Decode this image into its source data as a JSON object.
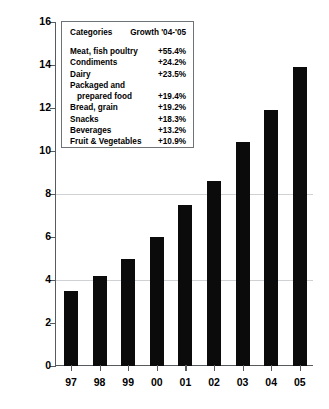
{
  "chart_data": {
    "type": "bar",
    "title": "",
    "xlabel": "",
    "ylabel": "Total sales [$ Billion]",
    "categories": [
      "97",
      "98",
      "99",
      "00",
      "01",
      "02",
      "03",
      "04",
      "05"
    ],
    "values": [
      3.5,
      4.2,
      5.0,
      6.0,
      7.5,
      8.6,
      10.4,
      11.9,
      13.9
    ],
    "ylim": [
      0,
      16
    ],
    "yticks": [
      0,
      2,
      4,
      6,
      8,
      10,
      12,
      14,
      16
    ],
    "ytick_labels": [
      "0",
      "2",
      "4",
      "6",
      "8",
      "10",
      "12",
      "14",
      "16"
    ],
    "grid": true,
    "legend_position": "upper-left-inset",
    "bar_color": "#0b0b0b",
    "series": [
      {
        "name": "Total sales",
        "values": [
          3.5,
          4.2,
          5.0,
          6.0,
          7.5,
          8.6,
          10.4,
          11.9,
          13.9
        ]
      }
    ],
    "annotations": {
      "table_title_left": "Categories",
      "table_title_right": "Growth '04-'05",
      "rows": [
        {
          "category": "Meat, fish poultry",
          "growth": "+55.4%"
        },
        {
          "category": "Condiments",
          "growth": "+24.2%"
        },
        {
          "category": "Dairy",
          "growth": "+23.5%"
        },
        {
          "category": "Packaged and",
          "growth": ""
        },
        {
          "category": "prepared food",
          "growth": "+19.4%"
        },
        {
          "category": "Bread, grain",
          "growth": "+19.2%"
        },
        {
          "category": "Snacks",
          "growth": "+18.3%"
        },
        {
          "category": "Beverages",
          "growth": "+13.2%"
        },
        {
          "category": "Fruit & Vegetables",
          "growth": "+10.9%"
        }
      ]
    }
  },
  "axis": {
    "y_title": "Total sales [$ Billion]"
  },
  "legend": {
    "header_left": "Categories",
    "header_right": "Growth '04-'05",
    "items": [
      {
        "label": "Meat, fish poultry",
        "value": "+55.4%",
        "indent": false
      },
      {
        "label": "Condiments",
        "value": "+24.2%",
        "indent": false
      },
      {
        "label": "Dairy",
        "value": "+23.5%",
        "indent": false
      },
      {
        "label": "Packaged and",
        "value": "",
        "indent": false
      },
      {
        "label": "prepared food",
        "value": "+19.4%",
        "indent": true
      },
      {
        "label": "Bread, grain",
        "value": "+19.2%",
        "indent": false
      },
      {
        "label": "Snacks",
        "value": "+18.3%",
        "indent": false
      },
      {
        "label": "Beverages",
        "value": "+13.2%",
        "indent": false
      },
      {
        "label": "Fruit & Vegetables",
        "value": "+10.9%",
        "indent": false
      }
    ]
  }
}
